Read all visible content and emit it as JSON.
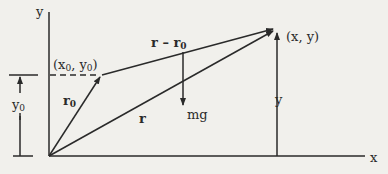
{
  "diagram": {
    "type": "projectile-position-vector-diagram",
    "colors": {
      "background": "#f1f0ec",
      "ink": "#2a2a2a"
    },
    "axes": {
      "x_label": "x",
      "y_label": "y"
    },
    "points": {
      "initial": {
        "label": "(x",
        "sub1": "0",
        "mid": ", y",
        "sub2": "0",
        "end": ")"
      },
      "current": {
        "label": "(x, y)"
      }
    },
    "vectors": {
      "r0": {
        "label": "r",
        "sub": "0"
      },
      "r": {
        "label": "r"
      },
      "r_minus_r0": {
        "label": "r – r",
        "sub": "0"
      },
      "gravity": {
        "label": "mg"
      }
    },
    "dimensions": {
      "y0": {
        "label": "y",
        "sub": "0"
      },
      "y": {
        "label": "y"
      }
    }
  }
}
